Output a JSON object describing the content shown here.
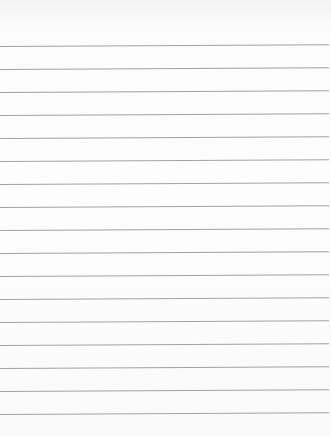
{
  "paper": {
    "type": "lined-paper",
    "background_color": "#fbfbfb",
    "line_color": "#a2a2a2",
    "line_count": 17,
    "first_line_y": 46,
    "line_spacing": 23
  }
}
